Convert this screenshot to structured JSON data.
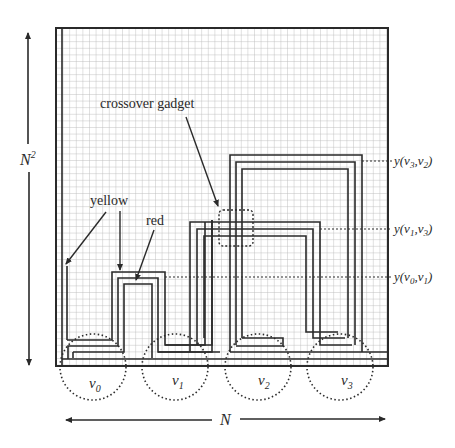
{
  "figure": {
    "axis_vertical_label": "N",
    "axis_vertical_sup": "2",
    "axis_horizontal_label": "N",
    "annotations": {
      "crossover": "crossover gadget",
      "yellow": "yellow",
      "red": "red"
    },
    "vertices": [
      {
        "name": "v",
        "sub": "0"
      },
      {
        "name": "v",
        "sub": "1"
      },
      {
        "name": "v",
        "sub": "2"
      },
      {
        "name": "v",
        "sub": "3"
      }
    ],
    "row_labels": [
      {
        "prefix": "y(v",
        "a": "3",
        "mid": ",v",
        "b": "2",
        "suffix": ")"
      },
      {
        "prefix": "y(v",
        "a": "1",
        "mid": ",v",
        "b": "3",
        "suffix": ")"
      },
      {
        "prefix": "y(v",
        "a": "0",
        "mid": ",v",
        "b": "1",
        "suffix": ")"
      }
    ],
    "colors": {
      "line": "#2a2a2a",
      "grid": "#bdbdbd",
      "background": "#ffffff"
    }
  }
}
